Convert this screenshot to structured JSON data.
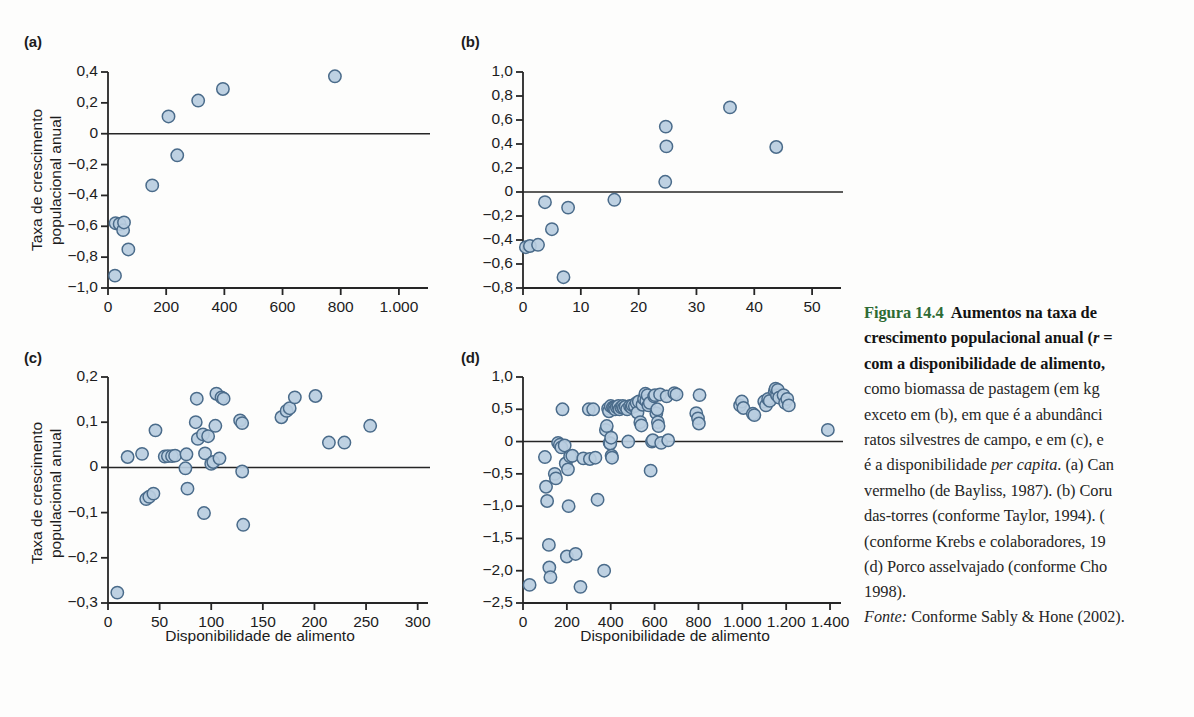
{
  "figure": {
    "number": "Figura 14.4",
    "caption_lines": [
      {
        "fig": "Figura 14.4",
        "bold": "  Aumentos na taxa de"
      },
      {
        "bold": "crescimento populacional anual (",
        "italic": "r",
        "bold2": " ="
      },
      {
        "bold": "com a disponibilidade de alimento,"
      },
      {
        "plain": "como biomassa de pastagem (em kg"
      },
      {
        "plain": "exceto em (b), em que é a abundânci"
      },
      {
        "plain": "ratos silvestres de campo, e em (c), e"
      },
      {
        "plain": "é a disponibilidade ",
        "italic": "per capita",
        "plain2": ". (a) Can"
      },
      {
        "plain": "vermelho (de Bayliss, 1987). (b) Coru"
      },
      {
        "plain": "das-torres (conforme Taylor, 1994). ("
      },
      {
        "plain": "(conforme Krebs e colaboradores, 19"
      },
      {
        "plain": "(d) Porco asselvajado (conforme Cho"
      },
      {
        "plain": "1998)."
      }
    ],
    "source_label": "Fonte:",
    "source_text": " Conforme Sably & Hone (2002).",
    "fig_label_color": "#2e6b35"
  },
  "style": {
    "marker_fill": "#b8cde0",
    "marker_stroke": "#4a6b8a",
    "axis_color": "#262626",
    "zero_line_color": "#262626"
  },
  "chart_data": [
    {
      "type": "scatter",
      "panel": "(a)",
      "title": "",
      "xlabel": "",
      "ylabel": "Taxa de crescimento populacional anual",
      "xlim": [
        0,
        1100
      ],
      "ylim": [
        -1.0,
        0.4
      ],
      "xticks": [
        0,
        200,
        400,
        600,
        800,
        1000
      ],
      "xticklabels": [
        "0",
        "200",
        "400",
        "600",
        "800",
        "1.000"
      ],
      "yticks": [
        -1.0,
        -0.8,
        -0.6,
        -0.4,
        -0.2,
        0,
        0.2,
        0.4
      ],
      "yticklabels": [
        "−1,0",
        "−0,8",
        "−0,6",
        "−0,4",
        "−0,2",
        "0",
        "0,2",
        "0,4"
      ],
      "grid": false,
      "zero_line": true,
      "points": [
        [
          24,
          -0.92
        ],
        [
          26,
          -0.58
        ],
        [
          40,
          -0.585
        ],
        [
          52,
          -0.625
        ],
        [
          55,
          -0.575
        ],
        [
          70,
          -0.75
        ],
        [
          152,
          -0.335
        ],
        [
          238,
          -0.14
        ],
        [
          208,
          0.112
        ],
        [
          310,
          0.215
        ],
        [
          395,
          0.29
        ],
        [
          780,
          0.372
        ]
      ]
    },
    {
      "type": "scatter",
      "panel": "(b)",
      "title": "",
      "xlabel": "",
      "ylabel": "",
      "xlim": [
        0,
        55
      ],
      "ylim": [
        -0.8,
        1.0
      ],
      "xticks": [
        0,
        10,
        20,
        30,
        40,
        50
      ],
      "xticklabels": [
        "0",
        "10",
        "20",
        "30",
        "40",
        "50"
      ],
      "yticks": [
        -0.8,
        -0.6,
        -0.4,
        -0.2,
        0,
        0.2,
        0.4,
        0.6,
        0.8,
        1.0
      ],
      "yticklabels": [
        "−0,8",
        "−0,6",
        "−0,4",
        "−0,2",
        "0",
        "0,2",
        "0,4",
        "0,6",
        "0,8",
        "1,0"
      ],
      "grid": false,
      "zero_line": true,
      "points": [
        [
          0.5,
          -0.46
        ],
        [
          1.2,
          -0.45
        ],
        [
          2.6,
          -0.44
        ],
        [
          3.8,
          -0.085
        ],
        [
          5.0,
          -0.31
        ],
        [
          7.0,
          -0.71
        ],
        [
          7.8,
          -0.13
        ],
        [
          15.8,
          -0.065
        ],
        [
          24.6,
          0.085
        ],
        [
          24.8,
          0.38
        ],
        [
          24.7,
          0.545
        ],
        [
          35.8,
          0.705
        ],
        [
          43.8,
          0.375
        ]
      ]
    },
    {
      "type": "scatter",
      "panel": "(c)",
      "title": "",
      "xlabel": "Disponibilidade de alimento",
      "ylabel": "Taxa de crescimento populacional anual",
      "xlim": [
        0,
        310
      ],
      "ylim": [
        -0.3,
        0.2
      ],
      "xticks": [
        0,
        50,
        100,
        150,
        200,
        250,
        300
      ],
      "xticklabels": [
        "0",
        "50",
        "100",
        "150",
        "200",
        "250",
        "300"
      ],
      "yticks": [
        -0.3,
        -0.2,
        -0.1,
        0,
        0.1,
        0.2
      ],
      "yticklabels": [
        "−0,3",
        "−0,2",
        "−0,1",
        "0",
        "0,1",
        "0,2"
      ],
      "grid": false,
      "zero_line": true,
      "points": [
        [
          9,
          -0.277
        ],
        [
          19,
          0.023
        ],
        [
          33,
          0.03
        ],
        [
          37,
          -0.07
        ],
        [
          40,
          -0.065
        ],
        [
          44,
          -0.058
        ],
        [
          46,
          0.082
        ],
        [
          55,
          0.024
        ],
        [
          58,
          0.025
        ],
        [
          62,
          0.025
        ],
        [
          65,
          0.026
        ],
        [
          75,
          -0.002
        ],
        [
          76,
          0.029
        ],
        [
          77,
          -0.047
        ],
        [
          85,
          0.1
        ],
        [
          86,
          0.152
        ],
        [
          87,
          0.063
        ],
        [
          92,
          0.073
        ],
        [
          93,
          -0.101
        ],
        [
          94,
          0.031
        ],
        [
          97,
          0.069
        ],
        [
          100,
          0.008
        ],
        [
          102,
          0.012
        ],
        [
          104,
          0.092
        ],
        [
          105,
          0.163
        ],
        [
          108,
          0.02
        ],
        [
          110,
          0.155
        ],
        [
          112,
          0.152
        ],
        [
          128,
          0.104
        ],
        [
          130,
          0.098
        ],
        [
          130,
          -0.009
        ],
        [
          131,
          -0.127
        ],
        [
          168,
          0.111
        ],
        [
          173,
          0.125
        ],
        [
          176,
          0.131
        ],
        [
          181,
          0.155
        ],
        [
          201,
          0.158
        ],
        [
          214,
          0.055
        ],
        [
          229,
          0.055
        ],
        [
          254,
          0.092
        ]
      ]
    },
    {
      "type": "scatter",
      "panel": "(d)",
      "title": "",
      "xlabel": "Disponibilidade de alimento",
      "ylabel": "",
      "xlim": [
        0,
        1450
      ],
      "ylim": [
        -2.5,
        1.0
      ],
      "xticks": [
        0,
        200,
        400,
        600,
        800,
        1000,
        1200,
        1400
      ],
      "xticklabels": [
        "0",
        "200",
        "400",
        "600",
        "800",
        "1.000",
        "1.200",
        "1.400"
      ],
      "yticks": [
        -2.5,
        -2.0,
        -1.5,
        -1.0,
        -0.5,
        0,
        0.5,
        1.0
      ],
      "yticklabels": [
        "−2,5",
        "−2,0",
        "−1,5",
        "−1,0",
        "−0,5",
        "0",
        "0,5",
        "1,0"
      ],
      "grid": false,
      "zero_line": true,
      "points": [
        [
          30,
          -2.22
        ],
        [
          100,
          -0.24
        ],
        [
          105,
          -0.7
        ],
        [
          110,
          -0.92
        ],
        [
          118,
          -1.6
        ],
        [
          120,
          -1.95
        ],
        [
          125,
          -2.1
        ],
        [
          145,
          -0.5
        ],
        [
          150,
          -0.57
        ],
        [
          160,
          -0.02
        ],
        [
          168,
          -0.05
        ],
        [
          175,
          -0.09
        ],
        [
          180,
          0.5
        ],
        [
          190,
          -0.06
        ],
        [
          195,
          -0.34
        ],
        [
          200,
          -1.78
        ],
        [
          205,
          -0.43
        ],
        [
          208,
          -1.0
        ],
        [
          215,
          -0.23
        ],
        [
          225,
          -0.22
        ],
        [
          240,
          -1.74
        ],
        [
          262,
          -2.25
        ],
        [
          275,
          -0.26
        ],
        [
          300,
          0.5
        ],
        [
          305,
          -0.27
        ],
        [
          320,
          0.5
        ],
        [
          330,
          -0.25
        ],
        [
          340,
          -0.9
        ],
        [
          370,
          -2.0
        ],
        [
          378,
          0.18
        ],
        [
          382,
          0.24
        ],
        [
          388,
          0.51
        ],
        [
          392,
          0.47
        ],
        [
          395,
          -0.02
        ],
        [
          398,
          -0.03
        ],
        [
          400,
          0.55
        ],
        [
          402,
          0.06
        ],
        [
          404,
          -0.22
        ],
        [
          406,
          -0.25
        ],
        [
          410,
          0.53
        ],
        [
          415,
          0.52
        ],
        [
          420,
          0.5
        ],
        [
          428,
          0.53
        ],
        [
          435,
          0.55
        ],
        [
          440,
          0.5
        ],
        [
          448,
          0.53
        ],
        [
          455,
          0.55
        ],
        [
          460,
          0.52
        ],
        [
          468,
          0.54
        ],
        [
          475,
          0.5
        ],
        [
          480,
          0.0
        ],
        [
          488,
          0.55
        ],
        [
          495,
          0.53
        ],
        [
          500,
          0.56
        ],
        [
          510,
          0.55
        ],
        [
          518,
          0.6
        ],
        [
          522,
          0.45
        ],
        [
          528,
          0.62
        ],
        [
          535,
          0.3
        ],
        [
          540,
          0.25
        ],
        [
          545,
          0.57
        ],
        [
          552,
          0.66
        ],
        [
          558,
          0.74
        ],
        [
          562,
          0.63
        ],
        [
          568,
          0.72
        ],
        [
          572,
          0.56
        ],
        [
          578,
          0.6
        ],
        [
          582,
          -0.45
        ],
        [
          588,
          0.0
        ],
        [
          592,
          0.02
        ],
        [
          598,
          0.7
        ],
        [
          602,
          0.72
        ],
        [
          608,
          0.44
        ],
        [
          612,
          0.5
        ],
        [
          615,
          0.3
        ],
        [
          618,
          0.24
        ],
        [
          625,
          0.73
        ],
        [
          630,
          -0.02
        ],
        [
          655,
          0.7
        ],
        [
          662,
          0.02
        ],
        [
          690,
          0.75
        ],
        [
          700,
          0.73
        ],
        [
          790,
          0.44
        ],
        [
          798,
          0.36
        ],
        [
          802,
          0.28
        ],
        [
          805,
          0.72
        ],
        [
          990,
          0.56
        ],
        [
          998,
          0.62
        ],
        [
          1005,
          0.52
        ],
        [
          1048,
          0.43
        ],
        [
          1055,
          0.41
        ],
        [
          1100,
          0.62
        ],
        [
          1108,
          0.56
        ],
        [
          1118,
          0.66
        ],
        [
          1125,
          0.63
        ],
        [
          1148,
          0.78
        ],
        [
          1152,
          0.82
        ],
        [
          1158,
          0.72
        ],
        [
          1162,
          0.8
        ],
        [
          1168,
          0.68
        ],
        [
          1188,
          0.72
        ],
        [
          1195,
          0.6
        ],
        [
          1205,
          0.66
        ],
        [
          1212,
          0.56
        ],
        [
          1390,
          0.18
        ]
      ]
    }
  ]
}
